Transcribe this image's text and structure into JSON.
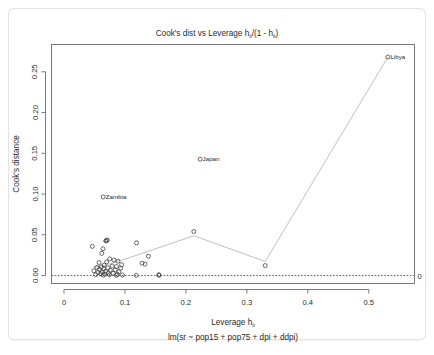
{
  "chart_data": {
    "type": "scatter",
    "title": "Cook's dist vs Leverage  hii/(1 - hii)",
    "title_main": "Cook's dist vs Leverage  h",
    "title_sub1": "ii",
    "title_mid": "/(1 - h",
    "title_sub2": "ii",
    "title_end": ")",
    "xlabel": "Leverage  h",
    "xlabel_sub": "ii",
    "subtitle": "lm(sr ~ pop15 + pop75 + dpi + ddpi)",
    "ylabel": "Cook's distance",
    "xlim": [
      -0.0205,
      0.575
    ],
    "ylim": [
      -0.0098,
      0.2835
    ],
    "xticks": [
      0,
      0.1,
      0.2,
      0.3,
      0.4,
      0.5
    ],
    "xtick_labels": [
      "0",
      "0.1",
      "0.2",
      "0.3",
      "0.4",
      "0.5"
    ],
    "yticks": [
      0.0,
      0.05,
      0.1,
      0.15,
      0.2,
      0.25
    ],
    "ytick_labels": [
      "0.00",
      "0.05",
      "0.10",
      "0.15",
      "0.20",
      "0.25"
    ],
    "grid": false,
    "legend": "none",
    "contour_levels": [
      0.5,
      1,
      1.5,
      2,
      2.5
    ],
    "contour_labels": [
      "0.5",
      "1",
      "1.5",
      "2",
      "2.5"
    ],
    "contour_zero_label": "0",
    "n_params": 5,
    "point_labels": [
      {
        "name": "Libya",
        "x": 0.5314,
        "y": 0.2681
      },
      {
        "name": "Japan",
        "x": 0.2233,
        "y": 0.1428
      },
      {
        "name": "Zambia",
        "x": 0.0643,
        "y": 0.0965
      }
    ],
    "points": [
      {
        "x": 0.5314,
        "y": 0.2681
      },
      {
        "x": 0.2233,
        "y": 0.1428
      },
      {
        "x": 0.0643,
        "y": 0.0965
      },
      {
        "x": 0.213,
        "y": 0.054
      },
      {
        "x": 0.071,
        "y": 0.0435
      },
      {
        "x": 0.0695,
        "y": 0.043
      },
      {
        "x": 0.0685,
        "y": 0.0424
      },
      {
        "x": 0.119,
        "y": 0.0401
      },
      {
        "x": 0.0465,
        "y": 0.0357
      },
      {
        "x": 0.064,
        "y": 0.0329
      },
      {
        "x": 0.062,
        "y": 0.0272
      },
      {
        "x": 0.1385,
        "y": 0.0236
      },
      {
        "x": 0.075,
        "y": 0.0204
      },
      {
        "x": 0.082,
        "y": 0.019
      },
      {
        "x": 0.0885,
        "y": 0.0175
      },
      {
        "x": 0.07,
        "y": 0.0168
      },
      {
        "x": 0.0575,
        "y": 0.016
      },
      {
        "x": 0.128,
        "y": 0.0152
      },
      {
        "x": 0.133,
        "y": 0.014
      },
      {
        "x": 0.0945,
        "y": 0.0133
      },
      {
        "x": 0.066,
        "y": 0.0128
      },
      {
        "x": 0.33,
        "y": 0.0122
      },
      {
        "x": 0.079,
        "y": 0.0116
      },
      {
        "x": 0.086,
        "y": 0.011
      },
      {
        "x": 0.061,
        "y": 0.0105
      },
      {
        "x": 0.054,
        "y": 0.01
      },
      {
        "x": 0.072,
        "y": 0.0094
      },
      {
        "x": 0.093,
        "y": 0.0089
      },
      {
        "x": 0.065,
        "y": 0.0082
      },
      {
        "x": 0.058,
        "y": 0.0076
      },
      {
        "x": 0.084,
        "y": 0.007
      },
      {
        "x": 0.076,
        "y": 0.0064
      },
      {
        "x": 0.049,
        "y": 0.0058
      },
      {
        "x": 0.068,
        "y": 0.0052
      },
      {
        "x": 0.09,
        "y": 0.0047
      },
      {
        "x": 0.063,
        "y": 0.0042
      },
      {
        "x": 0.0555,
        "y": 0.0037
      },
      {
        "x": 0.073,
        "y": 0.0032
      },
      {
        "x": 0.0805,
        "y": 0.0027
      },
      {
        "x": 0.06,
        "y": 0.0022
      },
      {
        "x": 0.067,
        "y": 0.0018
      },
      {
        "x": 0.0875,
        "y": 0.0014
      },
      {
        "x": 0.052,
        "y": 0.0011
      },
      {
        "x": 0.0745,
        "y": 0.0008
      },
      {
        "x": 0.096,
        "y": 0.0006
      },
      {
        "x": 0.0645,
        "y": 0.0004
      },
      {
        "x": 0.1185,
        "y": 0.0003
      },
      {
        "x": 0.1555,
        "y": 0.001
      },
      {
        "x": 0.156,
        "y": 0.0002
      },
      {
        "x": 0.086,
        "y": 0.0002
      }
    ],
    "smoother": [
      {
        "x": 0.048,
        "y": 0.0102
      },
      {
        "x": 0.069,
        "y": 0.0128
      },
      {
        "x": 0.119,
        "y": 0.0248
      },
      {
        "x": 0.213,
        "y": 0.0488
      },
      {
        "x": 0.33,
        "y": 0.0172
      },
      {
        "x": 0.5314,
        "y": 0.2681
      }
    ]
  }
}
